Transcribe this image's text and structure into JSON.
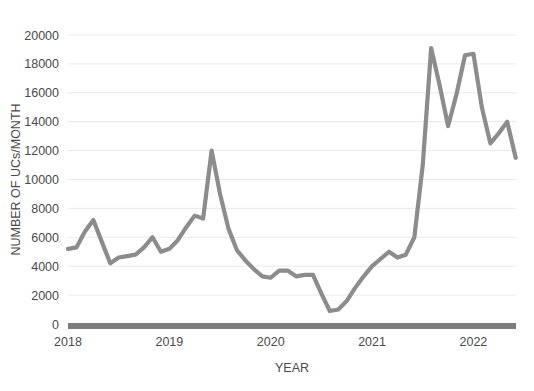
{
  "chart_data": {
    "type": "line",
    "title": "",
    "xlabel": "YEAR",
    "ylabel": "NUMBER OF UCs/MONTH",
    "ylim": [
      0,
      20000
    ],
    "ytick_step": 2000,
    "yticks": [
      "0",
      "2000",
      "4000",
      "6000",
      "8000",
      "10000",
      "12000",
      "14000",
      "16000",
      "18000",
      "20000"
    ],
    "xticks": [
      "2018",
      "2019",
      "2020",
      "2021",
      "2022"
    ],
    "xlim": [
      2018.0,
      2022.42
    ],
    "grid": "horizontal",
    "legend": "none",
    "line_color": "#8c8c8c",
    "axis_color": "#7d7d7d",
    "gridline_color": "#e9e9e9",
    "background_color": "#ffffff",
    "x": [
      2018.0,
      2018.083,
      2018.167,
      2018.25,
      2018.333,
      2018.417,
      2018.5,
      2018.583,
      2018.667,
      2018.75,
      2018.833,
      2018.917,
      2019.0,
      2019.083,
      2019.167,
      2019.25,
      2019.333,
      2019.417,
      2019.5,
      2019.583,
      2019.667,
      2019.75,
      2019.833,
      2019.917,
      2020.0,
      2020.083,
      2020.167,
      2020.25,
      2020.333,
      2020.417,
      2020.5,
      2020.583,
      2020.667,
      2020.75,
      2020.833,
      2020.917,
      2021.0,
      2021.083,
      2021.167,
      2021.25,
      2021.333,
      2021.417,
      2021.5,
      2021.583,
      2021.667,
      2021.75,
      2021.833,
      2021.917,
      2022.0,
      2022.083,
      2022.167,
      2022.25,
      2022.333,
      2022.417
    ],
    "series": [
      {
        "name": "UCs per month",
        "values": [
          5200,
          5300,
          6400,
          7200,
          5700,
          4200,
          4600,
          4700,
          4800,
          5300,
          6000,
          5000,
          5200,
          5800,
          6700,
          7500,
          7300,
          12000,
          9000,
          6600,
          5100,
          4400,
          3800,
          3300,
          3200,
          3700,
          3700,
          3300,
          3400,
          3400,
          2100,
          900,
          1000,
          1600,
          2500,
          3300,
          4000,
          4500,
          5000,
          4600,
          4800,
          6000,
          11000,
          19100,
          16500,
          13700,
          15900,
          18600,
          18700,
          15000,
          12500,
          13200,
          14000,
          11500
        ]
      }
    ],
    "annotations": []
  },
  "axis": {
    "y_title": "NUMBER OF UCs/MONTH",
    "x_title": "YEAR"
  }
}
